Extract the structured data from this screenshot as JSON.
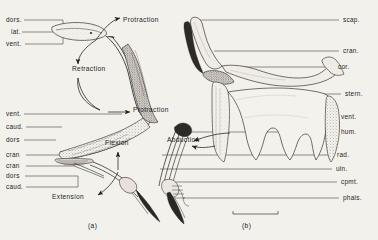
{
  "figure": {
    "background_color": "#f3f1ec",
    "ink_color": "#262320",
    "panels": [
      {
        "id": "a",
        "caption": "(a)",
        "description": "wing in lateral view with movement arrows"
      },
      {
        "id": "b",
        "caption": "(b)",
        "description": "pectoral girdle and wing skeleton with bone labels"
      }
    ]
  },
  "panel_a": {
    "left_labels": [
      {
        "key": "dors-upper",
        "text": "dors.",
        "x": 8,
        "y": 20,
        "leader_to_x": 63,
        "bracket": true
      },
      {
        "key": "lat",
        "text": "lat.",
        "x": 14,
        "y": 32,
        "leader_to_x": 63,
        "bracket": false
      },
      {
        "key": "vent-upper",
        "text": "vent.",
        "x": 8,
        "y": 44,
        "leader_to_x": 63,
        "bracket": true
      },
      {
        "key": "vent-lower",
        "text": "vent.",
        "x": 8,
        "y": 114,
        "leader_to_x": 68,
        "bracket": false
      },
      {
        "key": "caud-upper",
        "text": "caud.",
        "x": 8,
        "y": 127,
        "leader_to_x": 62,
        "bracket": false
      },
      {
        "key": "dors-mid",
        "text": "dors",
        "x": 8,
        "y": 140,
        "leader_to_x": 56,
        "bracket": false
      },
      {
        "key": "cran-upper",
        "text": "cran",
        "x": 8,
        "y": 155,
        "leader_to_x": 70,
        "bracket": true
      },
      {
        "key": "cran-lower",
        "text": "cran",
        "x": 8,
        "y": 166,
        "leader_to_x": 70,
        "bracket": false
      },
      {
        "key": "dors-lower",
        "text": "dors",
        "x": 8,
        "y": 176,
        "leader_to_x": 72,
        "bracket": false
      },
      {
        "key": "caud-lower",
        "text": "caud.",
        "x": 8,
        "y": 187,
        "leader_to_x": 72,
        "bracket": true
      }
    ],
    "action_labels": [
      {
        "key": "protraction-upper",
        "text": "Protraction",
        "x": 123,
        "y": 20
      },
      {
        "key": "retraction",
        "text": "Retraction",
        "x": 72,
        "y": 69
      },
      {
        "key": "protraction-lower",
        "text": "Protraction",
        "x": 133,
        "y": 110
      },
      {
        "key": "flexion",
        "text": "Flexion",
        "x": 105,
        "y": 143
      },
      {
        "key": "extension",
        "text": "Extension",
        "x": 52,
        "y": 197
      }
    ],
    "caption": "(a)",
    "caption_x": 88,
    "caption_y": 226
  },
  "panel_b": {
    "right_labels": [
      {
        "key": "scap",
        "text": "scap.",
        "y": 20,
        "leader_from_x": 196
      },
      {
        "key": "cran",
        "text": "cran.",
        "y": 51,
        "leader_from_x": 214
      },
      {
        "key": "cor",
        "text": "cor.",
        "y": 67,
        "leader_from_x": 228
      },
      {
        "key": "stern",
        "text": "stern.",
        "y": 94,
        "leader_from_x": 247
      },
      {
        "key": "vent",
        "text": "vent.",
        "y": 117,
        "leader_from_x": 247
      },
      {
        "key": "hum",
        "text": "hum.",
        "y": 132,
        "leader_from_x": 175
      },
      {
        "key": "rad",
        "text": "rad.",
        "y": 155,
        "leader_from_x": 162
      },
      {
        "key": "uln",
        "text": "uln.",
        "y": 169,
        "leader_from_x": 160
      },
      {
        "key": "cpmt",
        "text": "cpmt.",
        "y": 182,
        "leader_from_x": 163
      },
      {
        "key": "phals",
        "text": "phals.",
        "y": 198,
        "leader_from_x": 183
      }
    ],
    "action_labels": [
      {
        "key": "abduction",
        "text": "Abduction",
        "x": 167,
        "y": 140
      }
    ],
    "scale_bar": {
      "x": 233,
      "y": 214,
      "width": 45
    },
    "caption": "(b)",
    "caption_x": 242,
    "caption_y": 226
  }
}
